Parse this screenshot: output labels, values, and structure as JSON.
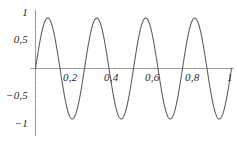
{
  "chart_data": {
    "type": "line",
    "title": "",
    "subtitle": "",
    "xlabel": "",
    "ylabel": "",
    "xlim": [
      0,
      1.04
    ],
    "ylim": [
      -1.12,
      1.12
    ],
    "grid": false,
    "legend": null,
    "legend_position": "none",
    "series": [
      {
        "name": "sin(8πx)",
        "expression": "sin(2*pi*4*x)",
        "color": "#5a5a5a",
        "amplitude": 1,
        "frequency_cycles_over_domain": 4,
        "x": [
          0,
          0.02,
          0.04,
          0.0625,
          0.08,
          0.1,
          0.125,
          0.145,
          0.165,
          0.1875,
          0.21,
          0.23,
          0.25,
          0.27,
          0.29,
          0.3125,
          0.33,
          0.35,
          0.375,
          0.395,
          0.415,
          0.4375,
          0.46,
          0.48,
          0.5,
          0.52,
          0.54,
          0.5625,
          0.58,
          0.6,
          0.625,
          0.645,
          0.665,
          0.6875,
          0.71,
          0.73,
          0.75,
          0.77,
          0.79,
          0.8125,
          0.83,
          0.85,
          0.875,
          0.895,
          0.915,
          0.9375,
          0.96,
          0.98,
          1
        ],
        "y": [
          0,
          0.4818,
          0.8443,
          1,
          0.9511,
          0.7071,
          0,
          -0.4818,
          -0.8443,
          -1,
          -0.9511,
          -0.7071,
          0,
          0.4818,
          0.8443,
          1,
          0.9511,
          0.7071,
          0,
          -0.4818,
          -0.8443,
          -1,
          -0.9511,
          -0.7071,
          0,
          0.4818,
          0.8443,
          1,
          0.9511,
          0.7071,
          0,
          -0.4818,
          -0.8443,
          -1,
          -0.9511,
          -0.7071,
          0,
          0.4818,
          0.8443,
          1,
          0.9511,
          0.7071,
          0,
          -0.4818,
          -0.8443,
          -1,
          -0.9511,
          -0.7071,
          0
        ]
      }
    ],
    "x_ticks": [
      {
        "value": 0.2,
        "label": "0,2"
      },
      {
        "value": 0.4,
        "label": "0,4"
      },
      {
        "value": 0.6,
        "label": "0,6"
      },
      {
        "value": 0.8,
        "label": "0,8"
      },
      {
        "value": 1.0,
        "label": "1"
      }
    ],
    "y_ticks": [
      {
        "value": 1.0,
        "label": "1"
      },
      {
        "value": 0.5,
        "label": "0,5"
      },
      {
        "value": -0.5,
        "label": "−0,5"
      },
      {
        "value": -1.0,
        "label": "−1"
      }
    ],
    "axes": {
      "x_axis_color": "#9a9a9a",
      "y_axis_color": "#9a9a9a",
      "minor_tick_color": "#d8d8d8"
    }
  },
  "labels": {
    "y_1": "1",
    "y_05": "0,5",
    "y_neg05": "−0,5",
    "y_neg1": "−1",
    "x_02": "0,2",
    "x_04": "0,4",
    "x_06": "0,6",
    "x_08": "0,8",
    "x_1": "1"
  }
}
